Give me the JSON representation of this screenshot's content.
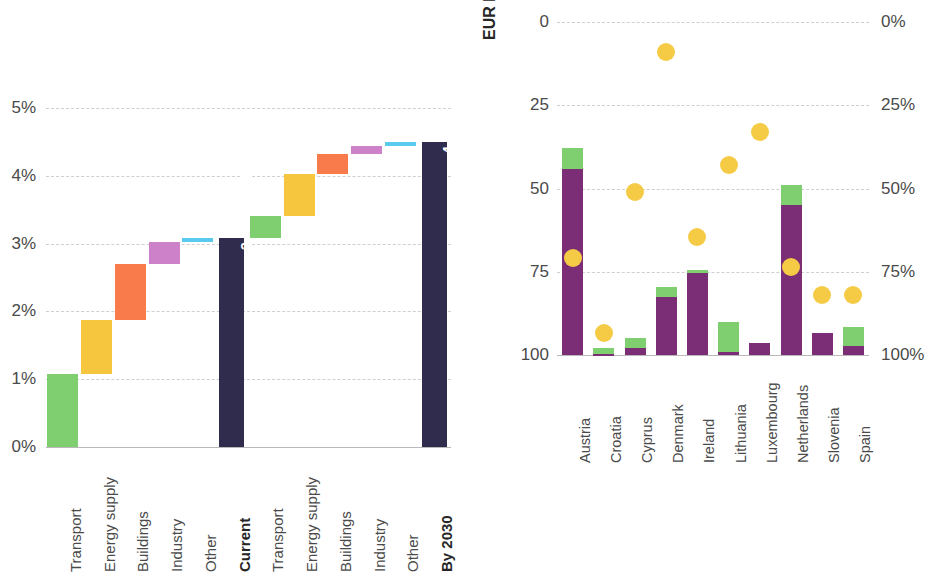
{
  "colors": {
    "green": "#7FCE6F",
    "yellow": "#F7C63F",
    "orange": "#F97A4B",
    "violet": "#CC81C8",
    "cyan": "#5CC9EF",
    "navy": "#2F2C4E",
    "purple": "#7B2D76",
    "dot_yellow": "#F5CB45",
    "grid": "#CFCFCF",
    "text": "#4A4A4A"
  },
  "chart_data": [
    {
      "type": "bar",
      "id": "waterfall",
      "title": "",
      "xlabel": "",
      "ylabel": "",
      "ylim": [
        0,
        5
      ],
      "ytick_labels": [
        "0%",
        "1%",
        "2%",
        "3%",
        "4%",
        "5%"
      ],
      "ytick_values": [
        0,
        1,
        2,
        3,
        4,
        5
      ],
      "grid": true,
      "legend": "none",
      "categories": [
        "Transport",
        "Energy supply",
        "Buildings",
        "Industry",
        "Other",
        "Current",
        "Transport",
        "Energy supply",
        "Buildings",
        "Industry",
        "Other",
        "By 2030"
      ],
      "bars": [
        {
          "label": "Transport",
          "kind": "delta",
          "base": 0.0,
          "top": 1.08,
          "color": "#7FCE6F",
          "group": "current"
        },
        {
          "label": "Energy supply",
          "kind": "delta",
          "base": 1.08,
          "top": 1.88,
          "color": "#F7C63F",
          "group": "current"
        },
        {
          "label": "Buildings",
          "kind": "delta",
          "base": 1.88,
          "top": 2.7,
          "color": "#F97A4B",
          "group": "current"
        },
        {
          "label": "Industry",
          "kind": "delta",
          "base": 2.7,
          "top": 3.02,
          "color": "#CC81C8",
          "group": "current"
        },
        {
          "label": "Other",
          "kind": "delta",
          "base": 3.02,
          "top": 3.08,
          "color": "#5CC9EF",
          "group": "current"
        },
        {
          "label": "Current",
          "kind": "total",
          "base": 0.0,
          "top": 3.08,
          "color": "#2F2C4E",
          "group": "current",
          "value_label": "3.1% of GDP"
        },
        {
          "label": "Transport",
          "kind": "delta",
          "base": 3.08,
          "top": 3.4,
          "color": "#7FCE6F",
          "group": "by2030"
        },
        {
          "label": "Energy supply",
          "kind": "delta",
          "base": 3.4,
          "top": 4.02,
          "color": "#F7C63F",
          "group": "by2030"
        },
        {
          "label": "Buildings",
          "kind": "delta",
          "base": 4.02,
          "top": 4.32,
          "color": "#F97A4B",
          "group": "by2030"
        },
        {
          "label": "Industry",
          "kind": "delta",
          "base": 4.32,
          "top": 4.44,
          "color": "#CC81C8",
          "group": "by2030"
        },
        {
          "label": "Other",
          "kind": "delta",
          "base": 4.44,
          "top": 4.5,
          "color": "#5CC9EF",
          "group": "by2030"
        },
        {
          "label": "By 2030",
          "kind": "total",
          "base": 0.0,
          "top": 4.5,
          "color": "#2F2C4E",
          "group": "by2030",
          "value_label": "4.5% of GDP"
        }
      ]
    },
    {
      "type": "bar",
      "id": "country-investments",
      "title": "",
      "xlabel": "",
      "ylabel": "EUR billion",
      "ylim": [
        0,
        100
      ],
      "ytick_labels": [
        "0",
        "25",
        "50",
        "75",
        "100"
      ],
      "ytick_values": [
        0,
        25,
        50,
        75,
        100
      ],
      "y2label": "",
      "y2lim": [
        0,
        100
      ],
      "y2tick_labels": [
        "0%",
        "25%",
        "50%",
        "75%",
        "100%"
      ],
      "y2tick_values": [
        0,
        25,
        50,
        75,
        100
      ],
      "grid": true,
      "legend_position": "bottom-left",
      "stacked": true,
      "categories": [
        "Austria",
        "Croatia",
        "Cyprus",
        "Denmark",
        "Ireland",
        "Lithuania",
        "Luxembourg",
        "Netherlands",
        "Slovenia",
        "Spain"
      ],
      "series": [
        {
          "name": "Public Investments until 2030",
          "color": "#7B2D76",
          "values": [
            56.0,
            0.3,
            2.0,
            17.5,
            24.5,
            1.0,
            3.5,
            45.0,
            6.5,
            2.8
          ]
        },
        {
          "name": "EU funds referenced in national plans",
          "color": "#7FCE6F",
          "values": [
            6.2,
            1.8,
            3.0,
            3.0,
            1.0,
            8.8,
            0.0,
            6.2,
            0.0,
            5.7
          ]
        },
        {
          "name": "Public investment as share of total (right axis)",
          "color": "#F5CB45",
          "type": "scatter",
          "axis": "right",
          "values": [
            29.0,
            6.5,
            49.0,
            91.0,
            35.5,
            57.0,
            67.0,
            26.5,
            18.0,
            18.0
          ]
        }
      ]
    }
  ],
  "left_chart": {
    "yticks": [
      "5%",
      "4%",
      "3%",
      "2%",
      "1%",
      "0%"
    ],
    "category_labels": [
      "Transport",
      "Energy supply",
      "Buildings",
      "Industry",
      "Other",
      "Current",
      "Transport",
      "Energy supply",
      "Buildings",
      "Industry",
      "Other",
      "By 2030"
    ],
    "total_labels": {
      "current": "3.1% of GDP",
      "by2030": "4.5% of GDP"
    }
  },
  "right_chart": {
    "y_axis_title": "EUR billion",
    "left_ticks": [
      "100",
      "75",
      "50",
      "25",
      "0"
    ],
    "right_ticks": [
      "100%",
      "75%",
      "50%",
      "25%",
      "0%"
    ],
    "countries": [
      "Austria",
      "Croatia",
      "Cyprus",
      "Denmark",
      "Ireland",
      "Lithuania",
      "Luxembourg",
      "Netherlands",
      "Slovenia",
      "Spain"
    ]
  },
  "legend": {
    "items": [
      {
        "label": "EU funds referenced in national plans",
        "color": "#7FCE6F",
        "shape": "square"
      },
      {
        "label": "Public Investments until 2030",
        "color": "#7B2D76",
        "shape": "square"
      },
      {
        "label": "Public investment as share of total (right axis)",
        "color": "#F5CB45",
        "shape": "circle"
      }
    ]
  }
}
